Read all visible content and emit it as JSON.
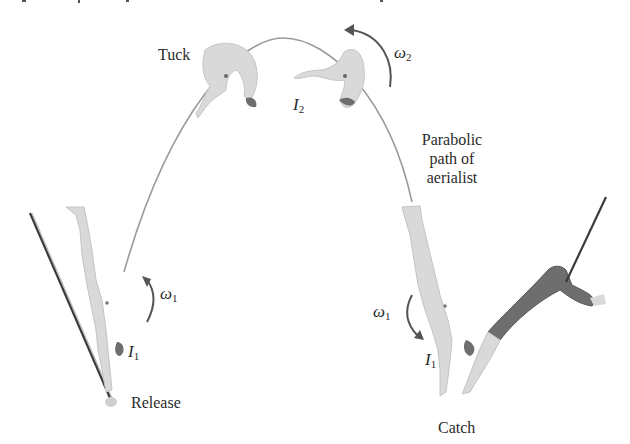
{
  "figure": {
    "type": "physics-illustration"
  },
  "labels": {
    "tuck": "Tuck",
    "path_line1": "Parabolic",
    "path_line2": "path of",
    "path_line3": "aerialist",
    "release": "Release",
    "catch": "Catch"
  },
  "symbols": {
    "omega_top": {
      "base": "ω",
      "sub": "2"
    },
    "inertia_top": {
      "base": "I",
      "sub": "2"
    },
    "omega_left": {
      "base": "ω",
      "sub": "1"
    },
    "inertia_left": {
      "base": "I",
      "sub": "1"
    },
    "omega_right": {
      "base": "ω",
      "sub": "1"
    },
    "inertia_right": {
      "base": "I",
      "sub": "1"
    }
  },
  "colors": {
    "figure_light": "#d9d9d9",
    "figure_mid": "#c8c8c8",
    "figure_dark": "#6e6e6e",
    "path": "#9a9a9a",
    "arrow": "#555555",
    "rope": "#3a3a3a",
    "text": "#2b2b2b"
  }
}
